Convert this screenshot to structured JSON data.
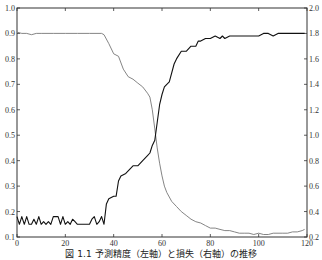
{
  "caption": "図 1.1  予測精度（左軸）と損失（右軸）の推移",
  "chart_data": {
    "type": "line",
    "title": "",
    "xlabel": "",
    "ylabel": "",
    "ylabel_right": "",
    "xlim": [
      0,
      120
    ],
    "ylim": [
      0.1,
      1.0
    ],
    "ylim_right": [
      0.2,
      2.0
    ],
    "x_ticks": [
      0,
      20,
      40,
      60,
      80,
      100,
      120
    ],
    "y_ticks_left": [
      "0.1",
      "0.2",
      "0.3",
      "0.4",
      "0.5",
      "0.6",
      "0.7",
      "0.8",
      "0.9",
      "1.0"
    ],
    "y_ticks_right": [
      "0.2",
      "0.4",
      "0.6",
      "0.8",
      "1.0",
      "1.2",
      "1.4",
      "1.6",
      "1.8",
      "2.0"
    ],
    "grid": false,
    "legend": null,
    "series": [
      {
        "name": "accuracy (left axis)",
        "axis": "left",
        "color": "#111111",
        "x": [
          0,
          1,
          2,
          3,
          4,
          5,
          6,
          7,
          8,
          9,
          10,
          11,
          12,
          13,
          14,
          15,
          16,
          17,
          18,
          19,
          20,
          21,
          22,
          23,
          24,
          25,
          26,
          27,
          28,
          29,
          30,
          31,
          32,
          33,
          34,
          35,
          36,
          37,
          38,
          40,
          41,
          42,
          43,
          45,
          47,
          48,
          50,
          52,
          54,
          55,
          56,
          57,
          58,
          59,
          60,
          61,
          62,
          63,
          65,
          66,
          68,
          70,
          72,
          74,
          75,
          76,
          78,
          80,
          82,
          84,
          85,
          86,
          88,
          90,
          92,
          94,
          95,
          96,
          98,
          100,
          102,
          104,
          106,
          108,
          110,
          112,
          114,
          116,
          118,
          119
        ],
        "y": [
          0.18,
          0.15,
          0.18,
          0.15,
          0.18,
          0.15,
          0.15,
          0.17,
          0.15,
          0.18,
          0.15,
          0.16,
          0.15,
          0.16,
          0.15,
          0.18,
          0.18,
          0.18,
          0.15,
          0.18,
          0.15,
          0.16,
          0.15,
          0.17,
          0.16,
          0.15,
          0.15,
          0.15,
          0.15,
          0.15,
          0.15,
          0.17,
          0.18,
          0.15,
          0.16,
          0.18,
          0.15,
          0.23,
          0.25,
          0.26,
          0.26,
          0.32,
          0.34,
          0.35,
          0.37,
          0.38,
          0.38,
          0.4,
          0.42,
          0.43,
          0.46,
          0.48,
          0.55,
          0.62,
          0.66,
          0.69,
          0.7,
          0.71,
          0.78,
          0.8,
          0.83,
          0.83,
          0.85,
          0.85,
          0.87,
          0.87,
          0.88,
          0.88,
          0.89,
          0.88,
          0.89,
          0.88,
          0.89,
          0.89,
          0.89,
          0.89,
          0.89,
          0.89,
          0.89,
          0.89,
          0.9,
          0.9,
          0.89,
          0.9,
          0.9,
          0.9,
          0.9,
          0.9,
          0.9,
          0.9
        ]
      },
      {
        "name": "loss (right axis)",
        "axis": "right",
        "color": "#777777",
        "x": [
          0,
          2,
          4,
          6,
          8,
          10,
          15,
          20,
          25,
          30,
          35,
          36,
          38,
          40,
          42,
          44,
          46,
          48,
          50,
          52,
          54,
          55,
          56,
          57,
          58,
          59,
          60,
          61,
          62,
          64,
          66,
          68,
          70,
          72,
          74,
          76,
          78,
          80,
          82,
          84,
          86,
          88,
          90,
          92,
          94,
          96,
          98,
          100,
          102,
          104,
          106,
          108,
          110,
          112,
          114,
          116,
          118,
          119
        ],
        "y": [
          1.81,
          1.8,
          1.8,
          1.79,
          1.8,
          1.8,
          1.8,
          1.8,
          1.8,
          1.8,
          1.8,
          1.79,
          1.72,
          1.64,
          1.62,
          1.52,
          1.46,
          1.44,
          1.41,
          1.38,
          1.33,
          1.3,
          1.2,
          1.05,
          0.9,
          0.78,
          0.68,
          0.6,
          0.55,
          0.48,
          0.44,
          0.4,
          0.37,
          0.34,
          0.32,
          0.31,
          0.29,
          0.27,
          0.27,
          0.26,
          0.25,
          0.25,
          0.24,
          0.23,
          0.23,
          0.23,
          0.22,
          0.23,
          0.22,
          0.22,
          0.23,
          0.23,
          0.23,
          0.23,
          0.24,
          0.24,
          0.25,
          0.26
        ]
      }
    ]
  }
}
